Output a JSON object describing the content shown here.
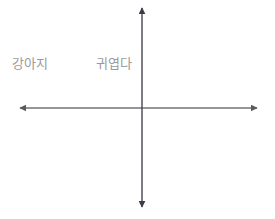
{
  "canvas": {
    "width": 275,
    "height": 219,
    "background_color": "#ffffff"
  },
  "diagram": {
    "type": "coordinate-plane",
    "axis_color": "#6b6b6b",
    "label_color": "#9a9a9a",
    "origin": {
      "x": 142,
      "y": 108
    },
    "axes": [
      {
        "name": "horizontal-axis",
        "orientation": "horizontal",
        "y": 108,
        "x_start": 18,
        "x_end": 259,
        "arrow_start": true,
        "arrow_end": true
      },
      {
        "name": "vertical-axis",
        "orientation": "vertical",
        "x": 142,
        "y_start": 6,
        "y_end": 209,
        "arrow_start": true,
        "arrow_end": true
      }
    ],
    "labels": [
      {
        "name": "label-puppy",
        "text": "강아지",
        "x": 12,
        "y": 57,
        "quadrant": "upper-left"
      },
      {
        "name": "label-cute",
        "text": "귀엽다",
        "x": 96,
        "y": 57,
        "quadrant": "upper-left"
      }
    ]
  }
}
